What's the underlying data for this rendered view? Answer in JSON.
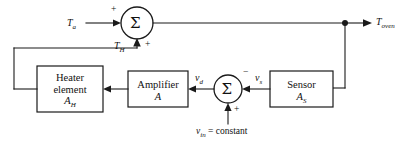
{
  "diagram": {
    "type": "control-system-block-diagram",
    "background_color": "#ffffff",
    "line_color": "#1a1a1a"
  },
  "signals": {
    "input_ambient": "T",
    "input_ambient_sub": "a",
    "heater_temp": "T",
    "heater_temp_sub": "H",
    "output": "T",
    "output_sub": "oven",
    "amp_input": "v",
    "amp_input_sub": "d",
    "sensor_output": "v",
    "sensor_output_sub": "s",
    "reference_var": "v",
    "reference_sub": "in",
    "reference_value": " = constant"
  },
  "signs": {
    "sum1_left": "+",
    "sum1_bottom": "+",
    "sum2_right": "−",
    "sum2_bottom": "+"
  },
  "sum_junctions": [
    {
      "id": "sum-top",
      "glyph": "Σ",
      "name": "summing-junction-top"
    },
    {
      "id": "sum-bottom",
      "glyph": "Σ",
      "name": "summing-junction-bottom"
    }
  ],
  "blocks": [
    {
      "id": "heater",
      "name": "heater-element-block",
      "line1": "Heater",
      "line2": "element",
      "gain_var": "A",
      "gain_sub": "H"
    },
    {
      "id": "amplifier",
      "name": "amplifier-block",
      "line1": "Amplifier",
      "line2": "",
      "gain_var": "A",
      "gain_sub": ""
    },
    {
      "id": "sensor",
      "name": "sensor-block",
      "line1": "Sensor",
      "line2": "",
      "gain_var": "A",
      "gain_sub": "S"
    }
  ]
}
